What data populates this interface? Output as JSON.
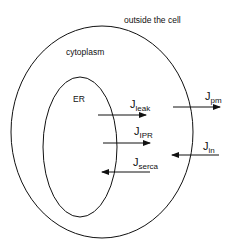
{
  "diagram": {
    "regions": {
      "outside": "outside the cell",
      "cytoplasm": "cytoplasm",
      "er": "ER"
    },
    "fluxes": [
      {
        "symbol": "J",
        "subscript": "leak",
        "direction": "right",
        "from": "ER",
        "to": "cytoplasm"
      },
      {
        "symbol": "J",
        "subscript": "pm",
        "direction": "right",
        "from": "cytoplasm",
        "to": "outside the cell"
      },
      {
        "symbol": "J",
        "subscript": "IPR",
        "direction": "right",
        "from": "ER",
        "to": "cytoplasm"
      },
      {
        "symbol": "J",
        "subscript": "in",
        "direction": "left",
        "from": "outside the cell",
        "to": "cytoplasm"
      },
      {
        "symbol": "J",
        "subscript": "serca",
        "direction": "left",
        "from": "cytoplasm",
        "to": "ER"
      }
    ],
    "colors": {
      "line": "#111111",
      "background": "#ffffff"
    }
  }
}
